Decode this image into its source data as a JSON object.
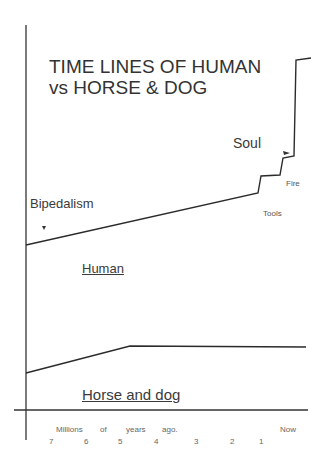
{
  "title": {
    "line1": "TIME LINES OF HUMAN",
    "line2": "vs HORSE & DOG"
  },
  "annotations": {
    "soul": "Soul",
    "fire": "Fire",
    "tools": "Tools",
    "bipedalism": "Bipedalism"
  },
  "series_labels": {
    "human": "Human",
    "horse_dog": "Horse and dog"
  },
  "x_axis": {
    "caption_words": [
      "Millions",
      "of",
      "years",
      "ago."
    ],
    "now_label": "Now",
    "ticks": [
      "7",
      "6",
      "5",
      "4",
      "3",
      "2",
      "1"
    ]
  },
  "colors": {
    "line": "#2b2b2b",
    "axis": "#333333",
    "text": "#3a3a3a"
  }
}
